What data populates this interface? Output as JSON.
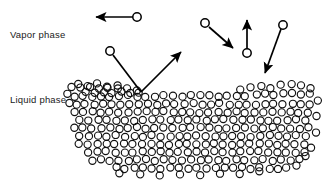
{
  "figure": {
    "background_color": "#ffffff",
    "width": 324,
    "height": 192,
    "line_color": "#000000",
    "molecule_stroke_color": "#111111",
    "label_color": "#1a1a1a"
  },
  "labels": {
    "vapor": "Vapor phase",
    "liquid": "Liquid phase"
  },
  "label_positions": {
    "vapor": {
      "x": 10,
      "y": 38
    },
    "liquid": {
      "x": 10,
      "y": 103
    }
  },
  "free_molecules": [
    {
      "id": "escaping-left",
      "cx": 137,
      "cy": 17,
      "r": 4.2
    },
    {
      "id": "incident-upper-left",
      "cx": 110,
      "cy": 51,
      "r": 4.2
    },
    {
      "id": "incident-mid-right",
      "cx": 205,
      "cy": 23,
      "r": 4.2
    },
    {
      "id": "evaporating-vertical",
      "cx": 247,
      "cy": 53,
      "r": 4.2
    },
    {
      "id": "condensing-right",
      "cx": 283,
      "cy": 25,
      "r": 4.2
    }
  ],
  "trajectories": [
    {
      "id": "escape-leftward",
      "description": "molecule leaving interface travelling left",
      "x1": 133,
      "y1": 17,
      "x2": 96,
      "y2": 17
    },
    {
      "id": "incoming-to-surface",
      "description": "molecule approaching the liquid surface",
      "x1": 113,
      "y1": 55,
      "x2": 141,
      "y2": 92
    },
    {
      "id": "reflected-from-surface",
      "description": "molecule rebounding up and to the right",
      "x1": 141,
      "y1": 92,
      "x2": 181,
      "y2": 52
    },
    {
      "id": "condensing-mid",
      "description": "molecule moving down-right toward the surface",
      "x1": 209,
      "y1": 27,
      "x2": 233,
      "y2": 48
    },
    {
      "id": "evaporating-up",
      "description": "molecule moving straight up away from liquid",
      "x1": 247,
      "y1": 49,
      "x2": 247,
      "y2": 20
    },
    {
      "id": "condensing-right-down",
      "description": "molecule moving down-left toward the surface",
      "x1": 281,
      "y1": 29,
      "x2": 265,
      "y2": 73
    }
  ],
  "liquid_region": {
    "molecule_radius": 3.6,
    "spacing_x": 9.0,
    "spacing_y": 8.2,
    "description": "densely packed circles representing liquid-phase molecules with a wavy upper surface",
    "rows": [
      {
        "y": 88,
        "x_start": 72,
        "x_end": 120,
        "offset": 0
      },
      {
        "y": 92,
        "x_start": 81,
        "x_end": 147,
        "offset": 4
      },
      {
        "y": 96,
        "x_start": 74,
        "x_end": 249,
        "offset": 0
      },
      {
        "y": 94,
        "x_start": 254,
        "x_end": 316,
        "offset": 2
      },
      {
        "y": 104,
        "x_start": 72,
        "x_end": 312,
        "offset": 4
      },
      {
        "y": 112,
        "x_start": 74,
        "x_end": 315,
        "offset": 0
      },
      {
        "y": 120,
        "x_start": 76,
        "x_end": 312,
        "offset": 4
      },
      {
        "y": 128,
        "x_start": 74,
        "x_end": 316,
        "offset": 0
      },
      {
        "y": 136,
        "x_start": 76,
        "x_end": 313,
        "offset": 4
      },
      {
        "y": 144,
        "x_start": 79,
        "x_end": 310,
        "offset": 0
      },
      {
        "y": 152,
        "x_start": 84,
        "x_end": 307,
        "offset": 4
      },
      {
        "y": 160,
        "x_start": 92,
        "x_end": 300,
        "offset": 0
      },
      {
        "y": 168,
        "x_start": 112,
        "x_end": 290,
        "offset": 4
      }
    ],
    "extra_molecules": [
      {
        "cx": 78,
        "cy": 84
      },
      {
        "cx": 88,
        "cy": 86
      },
      {
        "cx": 97,
        "cy": 83
      },
      {
        "cx": 107,
        "cy": 86
      },
      {
        "cx": 117,
        "cy": 85
      },
      {
        "cx": 127,
        "cy": 89
      },
      {
        "cx": 137,
        "cy": 90
      },
      {
        "cx": 261,
        "cy": 86
      },
      {
        "cx": 271,
        "cy": 88
      },
      {
        "cx": 281,
        "cy": 85
      },
      {
        "cx": 291,
        "cy": 84
      },
      {
        "cx": 301,
        "cy": 86
      },
      {
        "cx": 310,
        "cy": 88
      },
      {
        "cx": 240,
        "cy": 90
      },
      {
        "cx": 250,
        "cy": 88
      },
      {
        "cx": 68,
        "cy": 94
      },
      {
        "cx": 70,
        "cy": 103
      },
      {
        "cx": 318,
        "cy": 100
      },
      {
        "cx": 317,
        "cy": 116
      },
      {
        "cx": 316,
        "cy": 132
      },
      {
        "cx": 311,
        "cy": 148
      },
      {
        "cx": 305,
        "cy": 156
      },
      {
        "cx": 297,
        "cy": 166
      },
      {
        "cx": 120,
        "cy": 174
      },
      {
        "cx": 140,
        "cy": 174
      },
      {
        "cx": 160,
        "cy": 175
      },
      {
        "cx": 180,
        "cy": 175
      },
      {
        "cx": 200,
        "cy": 175
      },
      {
        "cx": 220,
        "cy": 174
      },
      {
        "cx": 240,
        "cy": 174
      },
      {
        "cx": 260,
        "cy": 172
      }
    ]
  }
}
